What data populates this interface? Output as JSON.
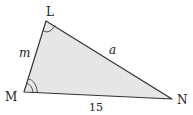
{
  "diagram": {
    "type": "triangle",
    "fill_color": "#e6e6e6",
    "stroke_color": "#333333",
    "vertices": {
      "L": {
        "label": "L",
        "x": 46,
        "y": 21
      },
      "M": {
        "label": "M",
        "x": 24,
        "y": 92
      },
      "N": {
        "label": "N",
        "x": 172,
        "y": 99
      }
    },
    "sides": {
      "LM": {
        "label": "m"
      },
      "LN": {
        "label": "a"
      },
      "MN": {
        "label": "15"
      }
    },
    "angle_marks": {
      "L": {
        "arcs": 1
      },
      "M": {
        "arcs": 2
      }
    }
  }
}
